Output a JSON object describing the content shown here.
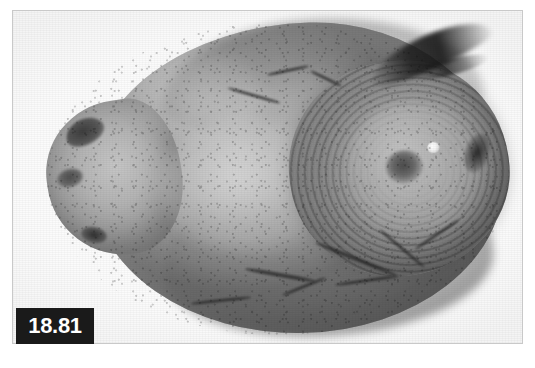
{
  "figure": {
    "number_label": "18.81",
    "label_text_color": "#ffffff",
    "label_background_color": "#1a1a1a",
    "frame_border_color": "#c9c9c9",
    "page_background_color": "#ffffff"
  },
  "photograph": {
    "kind": "grayscale-photograph",
    "subject_name": "ovoid-specimen",
    "caption_visible": false,
    "background_color": "#ffffff",
    "dominant_tones": [
      "#bdbdbd",
      "#a2a2a2",
      "#8a8a8a",
      "#6f6f6f",
      "#2a2a2a"
    ],
    "features": [
      {
        "name": "main-body",
        "description": "large smooth ovoid mass occupying the center of the plate"
      },
      {
        "name": "left-lobe",
        "description": "small rounded protrusion on the left side"
      },
      {
        "name": "concentric-bulge",
        "description": "raised dome on the right with concentric lamellated growth rings"
      },
      {
        "name": "umbilicus",
        "description": "dark central depression at the apex of the concentric bulge"
      },
      {
        "name": "specular-highlight",
        "description": "bright reflection spot to the right of the umbilicus"
      },
      {
        "name": "top-fissure",
        "description": "dark crevice running along the upper-right margin"
      },
      {
        "name": "surface-cracks",
        "description": "dark branching cracks over the lower-right quadrant"
      },
      {
        "name": "left-pits",
        "description": "dark pits on the left lobe"
      }
    ]
  }
}
